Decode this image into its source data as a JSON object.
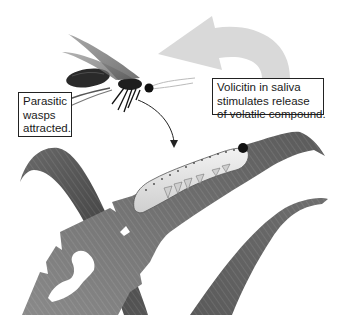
{
  "figure": {
    "labels": {
      "wasps": {
        "lines": [
          "Parasitic",
          "wasps",
          "attracted."
        ]
      },
      "volicitin": {
        "lines": [
          "Volicitin in saliva",
          "stimulates release",
          "of volatile compound."
        ]
      }
    },
    "elements": {
      "wasp": "parasitic-wasp-illustration",
      "caterpillar": "caterpillar-on-leaf",
      "release_arrow": "curved-arrow-volatile-release",
      "attraction_arrow": "arrow-wasp-to-caterpillar",
      "leaves": [
        "left-leaf",
        "chewed-leaf",
        "right-leaf"
      ]
    },
    "colors": {
      "leaf_dark": "#4a4a4a",
      "leaf_mid": "#7a7a7a",
      "leaf_light": "#9a9a9a",
      "big_arrow": "#d9d9d9",
      "caterpillar": "#e6e6e6",
      "wasp_body": "#2a2a2a",
      "label_border": "#222222"
    }
  }
}
